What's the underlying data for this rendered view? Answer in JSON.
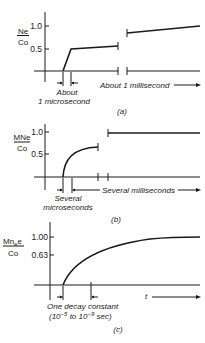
{
  "figure": {
    "panels": [
      {
        "id": "a",
        "caption": "(a)",
        "ylabel_num": "Ne",
        "ylabel_den": "Co",
        "yticks": [
          "1.0",
          "0.5"
        ],
        "annotation_left_1": "About",
        "annotation_left_2": "1 microsecond",
        "annotation_right": "About 1 millisecond"
      },
      {
        "id": "b",
        "caption": "(b)",
        "ylabel_num": "MNe",
        "ylabel_den": "Co",
        "yticks": [
          "1.0",
          "0.5"
        ],
        "annotation_left_1": "Several",
        "annotation_left_2": "microseconds",
        "annotation_right": "Several milliseconds"
      },
      {
        "id": "c",
        "caption": "(c)",
        "ylabel_num": "Mn",
        "ylabel_sub": "e",
        "ylabel_num_tail": "e",
        "ylabel_den": "Co",
        "yticks": [
          "1.00",
          "0.63"
        ],
        "annotation_left_1": "One decay constant",
        "annotation_left_2_a": "(10",
        "annotation_left_2_exp1": "−5",
        "annotation_left_2_b": " to 10",
        "annotation_left_2_exp2": "−9",
        "annotation_left_2_c": " sec)",
        "xlabel": "t"
      }
    ]
  }
}
